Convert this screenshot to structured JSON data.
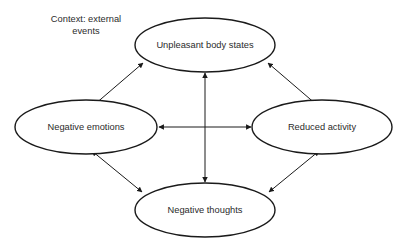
{
  "diagram": {
    "type": "cycle-diagram",
    "background_color": "#ffffff",
    "stroke_color": "#1a1a1a",
    "text_color": "#2b2b2b",
    "caption": {
      "lines": [
        "Context: external",
        "events"
      ],
      "line1": "Context: external",
      "line2": "events"
    },
    "nodes": [
      {
        "id": "unpleasant-body-states",
        "label": "Unpleasant body states",
        "position": "top",
        "cx": 205,
        "cy": 45,
        "rx": 70,
        "ry": 27
      },
      {
        "id": "negative-emotions",
        "label": "Negative emotions",
        "position": "left",
        "cx": 86,
        "cy": 127,
        "rx": 71,
        "ry": 27
      },
      {
        "id": "reduced-activity",
        "label": "Reduced activity",
        "position": "right",
        "cx": 322,
        "cy": 127,
        "rx": 70,
        "ry": 27
      },
      {
        "id": "negative-thoughts",
        "label": "Negative thoughts",
        "position": "bottom",
        "cx": 205,
        "cy": 210,
        "rx": 70,
        "ry": 27
      }
    ],
    "edges": [
      {
        "id": "edge-body-emotions",
        "from": "unpleasant-body-states",
        "to": "negative-emotions",
        "arrowheads": "both",
        "x1": 143,
        "y1": 63,
        "x2": 94,
        "y2": 105
      },
      {
        "id": "edge-body-activity",
        "from": "unpleasant-body-states",
        "to": "reduced-activity",
        "arrowheads": "both",
        "x1": 268,
        "y1": 63,
        "x2": 317,
        "y2": 105
      },
      {
        "id": "edge-emotions-thoughts",
        "from": "negative-emotions",
        "to": "negative-thoughts",
        "arrowheads": "both",
        "x1": 92,
        "y1": 151,
        "x2": 142,
        "y2": 192
      },
      {
        "id": "edge-activity-thoughts",
        "from": "reduced-activity",
        "to": "negative-thoughts",
        "arrowheads": "both",
        "x1": 319,
        "y1": 151,
        "x2": 269,
        "y2": 192
      },
      {
        "id": "edge-body-thoughts-vertical",
        "from": "unpleasant-body-states",
        "to": "negative-thoughts",
        "arrowheads": "both",
        "x1": 205,
        "y1": 73,
        "x2": 205,
        "y2": 182
      },
      {
        "id": "edge-emotions-activity-horizontal",
        "from": "negative-emotions",
        "to": "reduced-activity",
        "arrowheads": "both",
        "x1": 159,
        "y1": 127,
        "x2": 251,
        "y2": 127
      }
    ]
  }
}
